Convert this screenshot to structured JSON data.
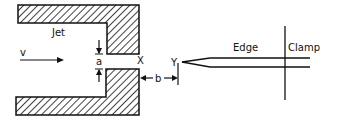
{
  "diagram": {
    "type": "edge-tone apparatus schematic",
    "labels": {
      "jet": "Jet",
      "velocity": "v",
      "gap": "a",
      "nozzle_exit": "X",
      "distance": "b",
      "edge_tip": "Y",
      "edge": "Edge",
      "clamp": "Clamp"
    },
    "colors": {
      "ink": "#111111",
      "background": "#ffffff"
    }
  }
}
